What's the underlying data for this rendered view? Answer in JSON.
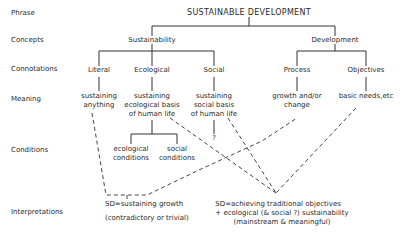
{
  "row_labels": {
    "phrase": "Phrase",
    "concepts": "Concepts",
    "connotations": "Connotations",
    "meaning": "Meaning",
    "conditions": "Conditions",
    "interpretations": "Interpretations"
  },
  "phrase": "SUSTAINABLE DEVELOPMENT",
  "concepts": {
    "sustainability": "Sustainability",
    "development": "Development"
  },
  "connotations": {
    "literal": "Literal",
    "ecological": "Ecological",
    "social": "Social",
    "process": "Process",
    "objectives": "Objectives"
  },
  "meaning": {
    "literal": [
      "sustaining",
      "anything"
    ],
    "ecological": [
      "sustaining",
      "ecological basis",
      "of human life"
    ],
    "social": [
      "sustaining",
      "social basis",
      "of human life"
    ],
    "process": [
      "growth and/or",
      "change"
    ],
    "objectives": [
      "basic needs,etc"
    ]
  },
  "conditions": {
    "ecological": [
      "ecological",
      "conditions"
    ],
    "social": [
      "social",
      "conditions"
    ],
    "social_question": "?"
  },
  "interpretations": {
    "left": {
      "line1": "SD=sustaining growth",
      "line2": "(contradictory or trivial)"
    },
    "right": {
      "line1": "SD=achieving traditional objectives",
      "line2": "+ ecological (& social ?) sustainability",
      "line3": "(mainstream & meaningful)"
    }
  }
}
